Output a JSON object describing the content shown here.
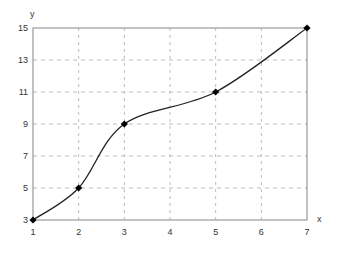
{
  "chart_data": {
    "type": "line",
    "title": "",
    "xlabel": "x",
    "ylabel": "y",
    "x": [
      1,
      2,
      3,
      5,
      7
    ],
    "series": [
      {
        "name": "y",
        "values": [
          3,
          5,
          9,
          11,
          15
        ],
        "smooth": true,
        "marker": "diamond",
        "color": "#000000"
      }
    ],
    "xlim": [
      1,
      7
    ],
    "ylim": [
      3,
      15
    ],
    "xticks": [
      1,
      2,
      3,
      4,
      5,
      6,
      7
    ],
    "yticks": [
      3,
      5,
      7,
      9,
      11,
      13,
      15
    ],
    "grid": true,
    "grid_style": "dashed",
    "legend": null
  },
  "colors": {
    "axis": "#999999",
    "grid": "#bbbbbb",
    "line": "#222222",
    "marker": "#000000",
    "text": "#333333"
  }
}
